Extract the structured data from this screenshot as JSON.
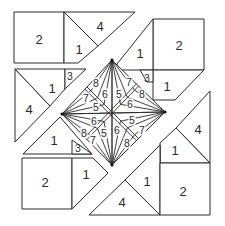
{
  "diagram": {
    "title": "",
    "stroke_color": "#2a2a2a",
    "background": "#ffffff",
    "blocks": [
      {
        "name": "top-left-block",
        "pieces": [
          {
            "name": "square-2",
            "points": "14,12 64,12 64,63 14,63"
          },
          {
            "name": "triangle-4",
            "points": "64,12 135,12 98,46"
          },
          {
            "name": "triangle-1",
            "points": "64,12 98,46 78,63 64,63"
          }
        ],
        "labels": [
          {
            "text": "2",
            "x": 39,
            "y": 39,
            "size": "big"
          },
          {
            "text": "4",
            "x": 100,
            "y": 26,
            "size": "big"
          },
          {
            "text": "1",
            "x": 79,
            "y": 49,
            "size": "big"
          }
        ]
      },
      {
        "name": "top-right-block",
        "pieces": [
          {
            "name": "square-2",
            "points": "153,19 204,19 204,70 153,70"
          },
          {
            "name": "triangle-1",
            "points": "153,19 153,70 117,70 117,64 153,19"
          },
          {
            "name": "triangle-1b",
            "points": "153,70 204,70 175,100 153,100"
          },
          {
            "name": "triangle-3",
            "points": "140,70 153,70 153,82 147,82"
          }
        ],
        "labels": [
          {
            "text": "2",
            "x": 179,
            "y": 45,
            "size": "big"
          },
          {
            "text": "1",
            "x": 140,
            "y": 53,
            "size": "big"
          },
          {
            "text": "1",
            "x": 167,
            "y": 86,
            "size": "big"
          },
          {
            "text": "3",
            "x": 147,
            "y": 78,
            "size": "small"
          }
        ]
      },
      {
        "name": "left-block",
        "pieces": [
          {
            "name": "triangle-4",
            "points": "15,69 15,142 50,106"
          },
          {
            "name": "triangle-1",
            "points": "15,69 65,69 65,89 50,106"
          },
          {
            "name": "triangle-3",
            "points": "65,69 86,69 65,89"
          }
        ],
        "labels": [
          {
            "text": "1",
            "x": 52,
            "y": 88,
            "size": "big"
          },
          {
            "text": "4",
            "x": 29,
            "y": 109,
            "size": "big"
          },
          {
            "text": "3",
            "x": 70,
            "y": 76,
            "size": "small"
          }
        ]
      },
      {
        "name": "bottom-left-block",
        "pieces": [
          {
            "name": "triangle-1",
            "points": "23,154 60,117 92,154"
          },
          {
            "name": "square-2",
            "points": "22,158 72,158 72,209 22,209"
          },
          {
            "name": "triangle-1b",
            "points": "72,158 93,158 108,173 72,209"
          },
          {
            "name": "triangle-3",
            "points": "72,140 72,154 92,154"
          }
        ],
        "labels": [
          {
            "text": "1",
            "x": 54,
            "y": 140,
            "size": "big"
          },
          {
            "text": "3",
            "x": 78,
            "y": 148,
            "size": "small"
          },
          {
            "text": "2",
            "x": 45,
            "y": 182,
            "size": "big"
          },
          {
            "text": "1",
            "x": 86,
            "y": 174,
            "size": "big"
          }
        ]
      },
      {
        "name": "right-block",
        "pieces": [
          {
            "name": "triangle-4",
            "points": "210,91 210,163 176,128"
          },
          {
            "name": "triangle-1",
            "points": "176,128 210,163 160,163 160,143"
          },
          {
            "name": "triangle-3",
            "points": "142,163 160,163 160,145"
          }
        ],
        "labels": [
          {
            "text": "4",
            "x": 198,
            "y": 129,
            "size": "big"
          },
          {
            "text": "1",
            "x": 175,
            "y": 150,
            "size": "big"
          },
          {
            "text": "3",
            "x": 154,
            "y": 158,
            "size": "small"
          }
        ]
      },
      {
        "name": "bottom-right-block",
        "pieces": [
          {
            "name": "triangle-4",
            "points": "89,215 160,215 125,180"
          },
          {
            "name": "triangle-1",
            "points": "125,180 160,145 160,215"
          },
          {
            "name": "square-2",
            "points": "160,163 210,163 210,215 160,215"
          }
        ],
        "labels": [
          {
            "text": "4",
            "x": 122,
            "y": 202,
            "size": "big"
          },
          {
            "text": "1",
            "x": 147,
            "y": 181,
            "size": "big"
          },
          {
            "text": "2",
            "x": 183,
            "y": 191,
            "size": "big"
          }
        ]
      }
    ],
    "center_diamond": {
      "top": [
        112,
        60
      ],
      "right": [
        165,
        112
      ],
      "bottom": [
        112,
        165
      ],
      "left": [
        62,
        114
      ],
      "labels": [
        {
          "text": "8",
          "x": 96,
          "y": 83,
          "size": "small"
        },
        {
          "text": "6",
          "x": 105,
          "y": 94,
          "size": "small"
        },
        {
          "text": "5",
          "x": 119,
          "y": 94,
          "size": "small"
        },
        {
          "text": "7",
          "x": 129,
          "y": 82,
          "size": "small"
        },
        {
          "text": "8",
          "x": 142,
          "y": 94,
          "size": "small"
        },
        {
          "text": "6",
          "x": 130,
          "y": 104,
          "size": "small"
        },
        {
          "text": "7",
          "x": 86,
          "y": 98,
          "size": "small"
        },
        {
          "text": "5",
          "x": 96,
          "y": 107,
          "size": "small"
        },
        {
          "text": "6",
          "x": 94,
          "y": 121,
          "size": "small"
        },
        {
          "text": "8",
          "x": 84,
          "y": 133,
          "size": "small"
        },
        {
          "text": "7",
          "x": 93,
          "y": 140,
          "size": "small"
        },
        {
          "text": "5",
          "x": 104,
          "y": 133,
          "size": "small"
        },
        {
          "text": "6",
          "x": 117,
          "y": 130,
          "size": "small"
        },
        {
          "text": "8",
          "x": 127,
          "y": 143,
          "size": "small"
        },
        {
          "text": "5",
          "x": 132,
          "y": 120,
          "size": "small"
        },
        {
          "text": "7",
          "x": 142,
          "y": 130,
          "size": "small"
        }
      ]
    }
  }
}
